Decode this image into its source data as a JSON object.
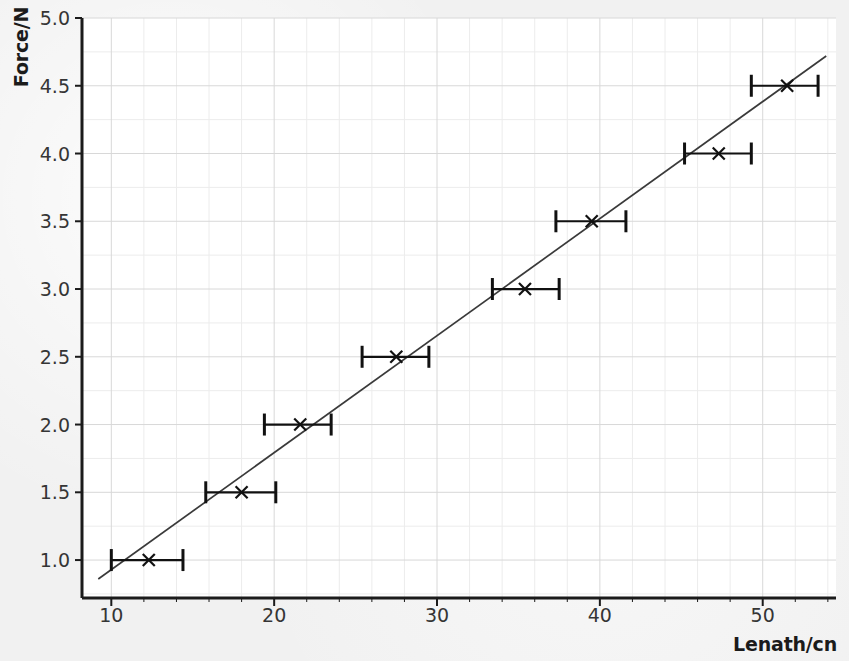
{
  "chart_data": {
    "type": "scatter",
    "title": "",
    "xlabel": "Lenath/cn",
    "ylabel": "Force/N",
    "xlim": [
      8.2,
      54.5
    ],
    "ylim": [
      0.72,
      5.0
    ],
    "xticks": [
      10,
      20,
      30,
      40,
      50
    ],
    "yticks": [
      1.0,
      1.5,
      2.0,
      2.5,
      3.0,
      3.5,
      4.0,
      4.5,
      5.0
    ],
    "xtick_labels": [
      "10",
      "20",
      "30",
      "40",
      "50"
    ],
    "ytick_labels": [
      "1.0",
      "1.5",
      "2.0",
      "2.5",
      "3.0",
      "3.5",
      "4.0",
      "4.5",
      "5.0"
    ],
    "grid": true,
    "minor_grid": true,
    "legend": "none",
    "marker": "x",
    "error_bars": "horizontal",
    "points": [
      {
        "x": 12.3,
        "y": 1.0,
        "xerr_low": 10.0,
        "xerr_high": 14.4
      },
      {
        "x": 18.0,
        "y": 1.5,
        "xerr_low": 15.8,
        "xerr_high": 20.1
      },
      {
        "x": 21.6,
        "y": 2.0,
        "xerr_low": 19.4,
        "xerr_high": 23.5
      },
      {
        "x": 27.5,
        "y": 2.5,
        "xerr_low": 25.4,
        "xerr_high": 29.5
      },
      {
        "x": 35.4,
        "y": 3.0,
        "xerr_low": 33.4,
        "xerr_high": 37.5
      },
      {
        "x": 39.5,
        "y": 3.5,
        "xerr_low": 37.3,
        "xerr_high": 41.6
      },
      {
        "x": 47.3,
        "y": 4.0,
        "xerr_low": 45.2,
        "xerr_high": 49.3
      },
      {
        "x": 51.5,
        "y": 4.5,
        "xerr_low": 49.3,
        "xerr_high": 53.4
      }
    ],
    "fit_line": {
      "x_start": 9.2,
      "y_start": 0.86,
      "x_end": 53.9,
      "y_end": 4.72,
      "slope": 0.0864,
      "intercept": 0.0652
    },
    "colors": {
      "axis": "#1b1b1b",
      "grid_major": "#d8d8d8",
      "grid_minor": "#ececec",
      "marker": "#111111",
      "line": "#3a3a3a",
      "background": "#f1f1f1",
      "plot_background": "#ffffff",
      "tick_text": "#353535"
    }
  }
}
